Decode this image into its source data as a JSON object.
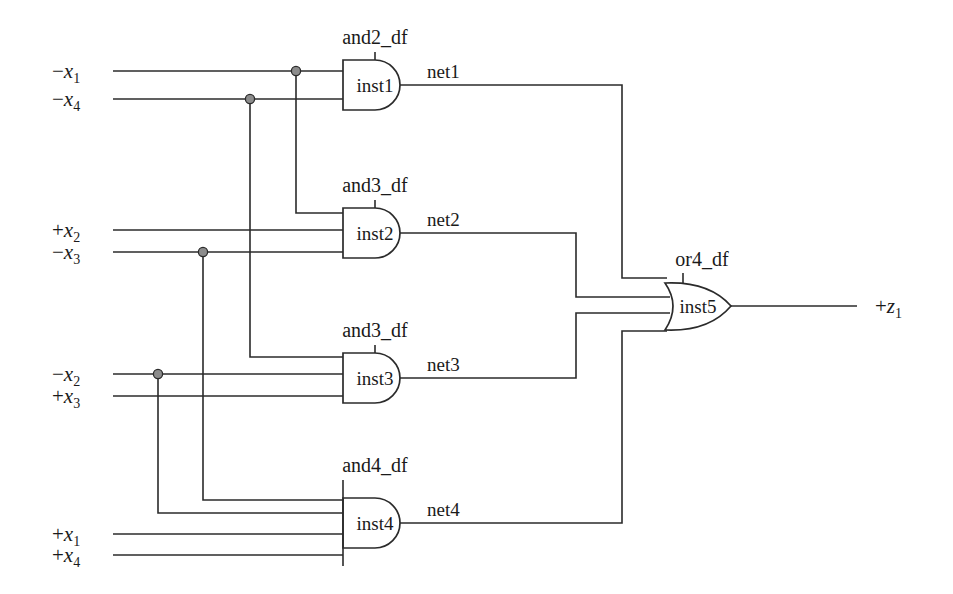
{
  "diagram": {
    "stroke_color": "#2b2b2b",
    "junction_color": "#8c8c8c",
    "background": "#ffffff"
  },
  "inputs": [
    {
      "id": "in-nx1",
      "sign": "−",
      "var": "x",
      "sub": "1",
      "y": 71
    },
    {
      "id": "in-nx4",
      "sign": "−",
      "var": "x",
      "sub": "4",
      "y": 99
    },
    {
      "id": "in-px2",
      "sign": "+",
      "var": "x",
      "sub": "2",
      "y": 230
    },
    {
      "id": "in-nx3",
      "sign": "−",
      "var": "x",
      "sub": "3",
      "y": 252
    },
    {
      "id": "in-nx2",
      "sign": "−",
      "var": "x",
      "sub": "2",
      "y": 374
    },
    {
      "id": "in-px3",
      "sign": "+",
      "var": "x",
      "sub": "3",
      "y": 396
    },
    {
      "id": "in-px1",
      "sign": "+",
      "var": "x",
      "sub": "1",
      "y": 534
    },
    {
      "id": "in-px4",
      "sign": "+",
      "var": "x",
      "sub": "4",
      "y": 555
    }
  ],
  "output": {
    "id": "out-pz1",
    "sign": "+",
    "var": "z",
    "sub": "1"
  },
  "gates": [
    {
      "id": "inst1",
      "type": "and2_df",
      "instance": "inst1",
      "kind": "and",
      "inputs": 2,
      "output_net": "net1"
    },
    {
      "id": "inst2",
      "type": "and3_df",
      "instance": "inst2",
      "kind": "and",
      "inputs": 3,
      "output_net": "net2"
    },
    {
      "id": "inst3",
      "type": "and3_df",
      "instance": "inst3",
      "kind": "and",
      "inputs": 3,
      "output_net": "net3"
    },
    {
      "id": "inst4",
      "type": "and4_df",
      "instance": "inst4",
      "kind": "and",
      "inputs": 4,
      "output_net": "net4"
    },
    {
      "id": "inst5",
      "type": "or4_df",
      "instance": "inst5",
      "kind": "or",
      "inputs": 4,
      "output_net": "+z1"
    }
  ],
  "nets": [
    {
      "name": "net1",
      "from": "inst1",
      "to": "inst5"
    },
    {
      "name": "net2",
      "from": "inst2",
      "to": "inst5"
    },
    {
      "name": "net3",
      "from": "inst3",
      "to": "inst5"
    },
    {
      "name": "net4",
      "from": "inst4",
      "to": "inst5"
    }
  ],
  "junctions": [
    {
      "on": "-x1",
      "x": 296,
      "y": 71,
      "feeds": "inst2"
    },
    {
      "on": "-x4",
      "x": 250,
      "y": 99,
      "feeds": "inst3"
    },
    {
      "on": "-x3",
      "x": 203,
      "y": 252,
      "feeds": "inst4"
    },
    {
      "on": "-x2",
      "x": 158,
      "y": 374,
      "feeds": "inst4"
    }
  ],
  "labels": {
    "and2_df": "and2_df",
    "and3_df": "and3_df",
    "and4_df": "and4_df",
    "or4_df": "or4_df",
    "inst1": "inst1",
    "inst2": "inst2",
    "inst3": "inst3",
    "inst4": "inst4",
    "inst5": "inst5",
    "net1": "net1",
    "net2": "net2",
    "net3": "net3",
    "net4": "net4"
  }
}
